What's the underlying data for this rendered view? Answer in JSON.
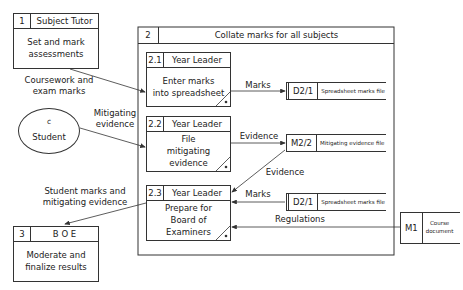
{
  "diagram": {
    "type": "data-flow-diagram",
    "processes": [
      {
        "id": "1",
        "role": "Subject Tutor",
        "description": "Set and mark\nassessments"
      },
      {
        "id": "2",
        "role": "",
        "description": "Collate marks for all subjects"
      },
      {
        "id": "2.1",
        "role": "Year Leader",
        "description": "Enter marks\ninto spreadsheet"
      },
      {
        "id": "2.2",
        "role": "Year Leader",
        "description": "File\nmitigating\nevidence"
      },
      {
        "id": "2.3",
        "role": "Year Leader",
        "description": "Prepare for\nBoard of\nExaminers"
      },
      {
        "id": "3",
        "role": "B O E",
        "description": "Moderate and\nfinalize results"
      }
    ],
    "external_entities": [
      {
        "id": "c",
        "name": "Student"
      }
    ],
    "data_stores": [
      {
        "id": "D2/1",
        "name": "Spreadsheet marks file"
      },
      {
        "id": "M2/2",
        "name": "Mitigating evidence file"
      },
      {
        "id": "D2/1",
        "name": "Spreadsheet marks file"
      },
      {
        "id": "M1",
        "name": "Course\ndocument"
      }
    ],
    "flows": [
      {
        "from": "1",
        "to": "2.1",
        "label": "Coursework and\nexam marks"
      },
      {
        "from": "c",
        "to": "2.2",
        "label": "Mitigating\nevidence"
      },
      {
        "from": "2.1",
        "to": "D2/1",
        "label": "Marks"
      },
      {
        "from": "2.2",
        "to": "M2/2",
        "label": "Evidence"
      },
      {
        "from": "M2/2",
        "to": "2.3",
        "label": "Evidence"
      },
      {
        "from": "D2/1",
        "to": "2.3",
        "label": "Marks"
      },
      {
        "from": "M1",
        "to": "2.3",
        "label": "Regulations"
      },
      {
        "from": "2.3",
        "to": "3",
        "label": "Student marks and\nmitigating evidence"
      }
    ]
  }
}
